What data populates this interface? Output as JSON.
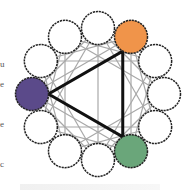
{
  "diagram": {
    "center": [
      98,
      94
    ],
    "ring_radius": 66,
    "circle_radius": 16.5,
    "circle_count": 12,
    "circle_stroke": "#222222",
    "chord_color": "#a8a8a8",
    "triangle_color": "#111111",
    "circles": [
      {
        "angle": 0,
        "fill": "#ffffff"
      },
      {
        "angle": 30,
        "fill": "#f0944a",
        "label": "orange"
      },
      {
        "angle": 60,
        "fill": "#ffffff"
      },
      {
        "angle": 90,
        "fill": "#ffffff"
      },
      {
        "angle": 120,
        "fill": "#ffffff"
      },
      {
        "angle": 150,
        "fill": "#6aa67a",
        "label": "green"
      },
      {
        "angle": 180,
        "fill": "#ffffff"
      },
      {
        "angle": 210,
        "fill": "#ffffff"
      },
      {
        "angle": 240,
        "fill": "#ffffff"
      },
      {
        "angle": 270,
        "fill": "#5b4a8a",
        "label": "purple"
      },
      {
        "angle": 300,
        "fill": "#ffffff"
      },
      {
        "angle": 330,
        "fill": "#ffffff"
      }
    ],
    "triangle_vertices": [
      1,
      5,
      9
    ]
  },
  "side_text": [
    {
      "text": "u",
      "top": 60
    },
    {
      "text": "e",
      "top": 80
    },
    {
      "text": "e",
      "top": 120
    },
    {
      "text": "c",
      "top": 160
    }
  ]
}
